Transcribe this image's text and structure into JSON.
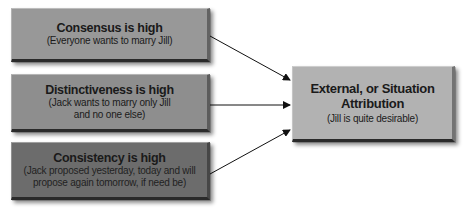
{
  "diagram": {
    "causes": [
      {
        "title": "Consensus is high",
        "detail": "(Everyone wants to marry Jill)",
        "color": "#989898"
      },
      {
        "title": "Distinctiveness is high",
        "detail_line1": "(Jack wants to marry only Jill",
        "detail_line2": "and no one else)",
        "color": "#8e8e8e"
      },
      {
        "title": "Consistency is high",
        "detail_line1": "(Jack proposed yesterday, today and will",
        "detail_line2": "propose again tomorrow, if need be)",
        "color": "#6c6c6c"
      }
    ],
    "result": {
      "title_line1": "External, or Situation",
      "title_line2": "Attribution",
      "detail": "(Jill is quite desirable)",
      "color": "#b2b2b2"
    },
    "arrows": [
      {
        "from": "Consensus is high",
        "to": "External, or Situation Attribution"
      },
      {
        "from": "Distinctiveness is high",
        "to": "External, or Situation Attribution"
      },
      {
        "from": "Consistency is high",
        "to": "External, or Situation Attribution"
      }
    ]
  }
}
